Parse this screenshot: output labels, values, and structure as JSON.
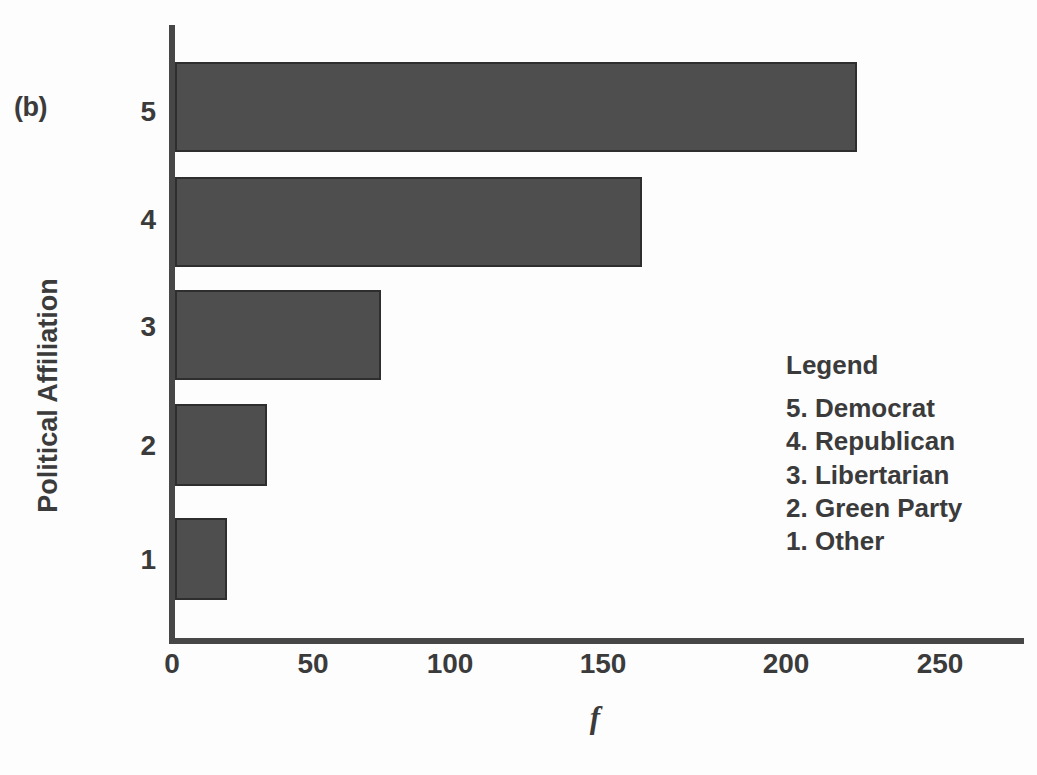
{
  "panel": {
    "label": "(b)"
  },
  "axes": {
    "ylabel": "Political Affiliation",
    "xlabel": "f",
    "xticks": [
      "0",
      "50",
      "100",
      "150",
      "200",
      "250"
    ],
    "yticks": [
      "5",
      "4",
      "3",
      "2",
      "1"
    ]
  },
  "legend": {
    "title": "Legend",
    "items": [
      "5. Democrat",
      "4. Republican",
      "3. Libertarian",
      "2. Green Party",
      "1. Other"
    ]
  },
  "colors": {
    "bar_fill": "#4e4e4e",
    "bar_edge": "#2e2e2e",
    "axis": "#474747",
    "text": "#3b3b3b",
    "background": "#fdfdfd"
  },
  "chart_data": {
    "type": "bar",
    "orientation": "horizontal",
    "title": "",
    "subtitle": "",
    "xlabel": "f",
    "ylabel": "Political Affiliation",
    "categories": [
      "5",
      "4",
      "3",
      "2",
      "1"
    ],
    "category_names": [
      "Democrat",
      "Republican",
      "Libertarian",
      "Green Party",
      "Other"
    ],
    "values": [
      222,
      152,
      67,
      30,
      17
    ],
    "xlim": [
      0,
      278
    ],
    "ylim": [
      0.5,
      5.5
    ],
    "xticks": [
      0,
      50,
      100,
      150,
      200,
      250
    ],
    "yticks": [
      5,
      4,
      3,
      2,
      1
    ],
    "grid": false,
    "legend_position": "inside-right",
    "legend_entries": [
      "5. Democrat",
      "4. Republican",
      "3. Libertarian",
      "2. Green Party",
      "1. Other"
    ],
    "annotations": [
      "(b)"
    ]
  }
}
